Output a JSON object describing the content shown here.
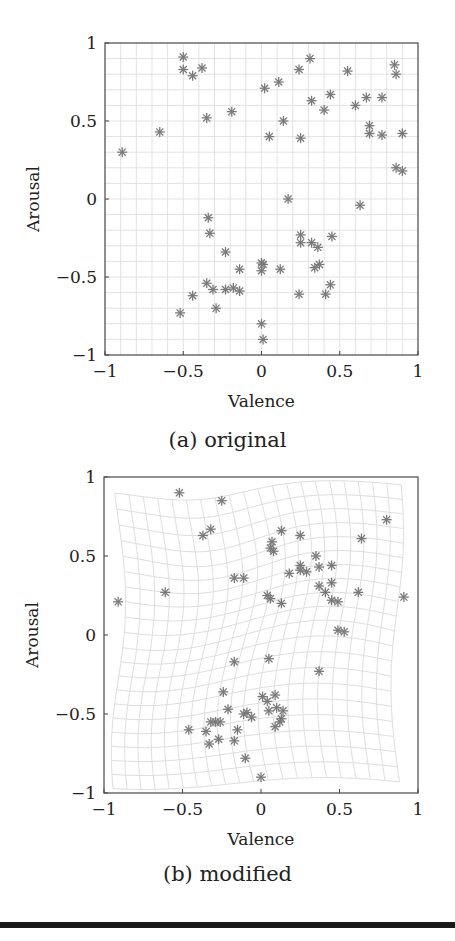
{
  "chart_data": [
    {
      "type": "scatter",
      "panel": "a",
      "caption": "(a) original",
      "xlabel": "Valence",
      "ylabel": "Arousal",
      "xlim": [
        -1,
        1
      ],
      "ylim": [
        -1,
        1
      ],
      "xticks": [
        "-1",
        "-0.5",
        "0",
        "0.5",
        "1"
      ],
      "yticks": [
        "-1",
        "-0.5",
        "0",
        "0.5",
        "1"
      ],
      "grid": "regular",
      "marker": "asterisk",
      "marker_color": "#7a7a7a",
      "points": [
        [
          -0.5,
          0.91
        ],
        [
          -0.5,
          0.83
        ],
        [
          -0.44,
          0.79
        ],
        [
          -0.38,
          0.84
        ],
        [
          -0.35,
          0.52
        ],
        [
          -0.19,
          0.56
        ],
        [
          -0.65,
          0.43
        ],
        [
          -0.89,
          0.3
        ],
        [
          0.02,
          0.71
        ],
        [
          0.11,
          0.75
        ],
        [
          0.24,
          0.83
        ],
        [
          0.31,
          0.9
        ],
        [
          0.55,
          0.82
        ],
        [
          0.05,
          0.4
        ],
        [
          0.14,
          0.5
        ],
        [
          0.32,
          0.63
        ],
        [
          0.44,
          0.67
        ],
        [
          0.25,
          0.39
        ],
        [
          0.4,
          0.57
        ],
        [
          0.6,
          0.6
        ],
        [
          0.67,
          0.65
        ],
        [
          0.77,
          0.65
        ],
        [
          0.69,
          0.47
        ],
        [
          0.69,
          0.42
        ],
        [
          0.77,
          0.41
        ],
        [
          0.85,
          0.86
        ],
        [
          0.86,
          0.8
        ],
        [
          0.9,
          0.42
        ],
        [
          0.86,
          0.2
        ],
        [
          0.9,
          0.18
        ],
        [
          0.63,
          -0.04
        ],
        [
          0.17,
          0.0
        ],
        [
          -0.34,
          -0.12
        ],
        [
          -0.33,
          -0.22
        ],
        [
          -0.23,
          -0.34
        ],
        [
          -0.14,
          -0.45
        ],
        [
          -0.35,
          -0.54
        ],
        [
          -0.31,
          -0.58
        ],
        [
          -0.23,
          -0.58
        ],
        [
          -0.18,
          -0.57
        ],
        [
          -0.14,
          -0.59
        ],
        [
          -0.44,
          -0.62
        ],
        [
          -0.29,
          -0.7
        ],
        [
          -0.52,
          -0.73
        ],
        [
          0.0,
          -0.41
        ],
        [
          0.0,
          -0.46
        ],
        [
          0.01,
          -0.42
        ],
        [
          0.12,
          -0.45
        ],
        [
          0.25,
          -0.23
        ],
        [
          0.25,
          -0.28
        ],
        [
          0.32,
          -0.28
        ],
        [
          0.36,
          -0.31
        ],
        [
          0.34,
          -0.44
        ],
        [
          0.37,
          -0.42
        ],
        [
          0.45,
          -0.24
        ],
        [
          0.24,
          -0.61
        ],
        [
          0.44,
          -0.55
        ],
        [
          0.41,
          -0.61
        ],
        [
          0.0,
          -0.8
        ],
        [
          0.01,
          -0.9
        ]
      ]
    },
    {
      "type": "scatter",
      "panel": "b",
      "caption": "(b) modified",
      "xlabel": "Valence",
      "ylabel": "Arousal",
      "xlim": [
        -1,
        1
      ],
      "ylim": [
        -1,
        1
      ],
      "xticks": [
        "-1",
        "-0.5",
        "0",
        "0.5",
        "1"
      ],
      "yticks": [
        "-1",
        "-0.5",
        "0",
        "0.5",
        "1"
      ],
      "grid": "warped",
      "marker": "asterisk",
      "marker_color": "#7a7a7a",
      "points": [
        [
          -0.52,
          0.9
        ],
        [
          -0.25,
          0.85
        ],
        [
          -0.37,
          0.63
        ],
        [
          -0.32,
          0.67
        ],
        [
          -0.91,
          0.21
        ],
        [
          -0.61,
          0.27
        ],
        [
          -0.17,
          0.36
        ],
        [
          -0.11,
          0.36
        ],
        [
          0.06,
          0.55
        ],
        [
          0.07,
          0.59
        ],
        [
          0.13,
          0.66
        ],
        [
          0.25,
          0.63
        ],
        [
          0.08,
          0.53
        ],
        [
          0.04,
          0.25
        ],
        [
          0.06,
          0.23
        ],
        [
          0.13,
          0.2
        ],
        [
          0.18,
          0.39
        ],
        [
          0.25,
          0.41
        ],
        [
          0.29,
          0.4
        ],
        [
          0.25,
          0.44
        ],
        [
          0.35,
          0.5
        ],
        [
          0.37,
          0.43
        ],
        [
          0.45,
          0.44
        ],
        [
          0.37,
          0.31
        ],
        [
          0.41,
          0.27
        ],
        [
          0.45,
          0.33
        ],
        [
          0.49,
          0.21
        ],
        [
          0.45,
          0.22
        ],
        [
          0.62,
          0.27
        ],
        [
          0.64,
          0.61
        ],
        [
          0.8,
          0.73
        ],
        [
          0.91,
          0.24
        ],
        [
          0.49,
          0.03
        ],
        [
          0.53,
          0.02
        ],
        [
          0.37,
          -0.23
        ],
        [
          0.05,
          -0.15
        ],
        [
          -0.17,
          -0.17
        ],
        [
          -0.24,
          -0.36
        ],
        [
          -0.21,
          -0.47
        ],
        [
          -0.46,
          -0.6
        ],
        [
          -0.35,
          -0.61
        ],
        [
          -0.32,
          -0.55
        ],
        [
          -0.29,
          -0.55
        ],
        [
          -0.26,
          -0.55
        ],
        [
          -0.33,
          -0.69
        ],
        [
          -0.27,
          -0.66
        ],
        [
          -0.15,
          -0.6
        ],
        [
          -0.11,
          -0.5
        ],
        [
          -0.09,
          -0.49
        ],
        [
          -0.06,
          -0.52
        ],
        [
          -0.17,
          -0.67
        ],
        [
          -0.1,
          -0.78
        ],
        [
          0.01,
          -0.39
        ],
        [
          0.09,
          -0.38
        ],
        [
          0.05,
          -0.48
        ],
        [
          0.1,
          -0.46
        ],
        [
          0.12,
          -0.55
        ],
        [
          0.14,
          -0.48
        ],
        [
          0.13,
          -0.53
        ],
        [
          0.09,
          -0.58
        ],
        [
          0.04,
          -0.42
        ],
        [
          0.0,
          -0.9
        ]
      ]
    }
  ],
  "captions": {
    "a": "(a) original",
    "b": "(b) modified"
  },
  "axes": {
    "xlabel": "Valence",
    "ylabel": "Arousal"
  }
}
